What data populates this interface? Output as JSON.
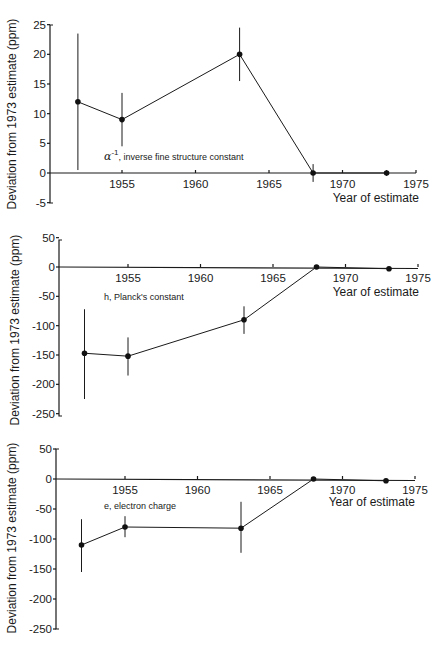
{
  "chart_data": [
    {
      "type": "line",
      "title": "",
      "annotation": "α⁻¹, inverse fine structure constant",
      "annotation_symbol": "α",
      "annotation_sup": "-1",
      "annotation_rest": ", inverse fine structure constant",
      "xlabel": "Year of estimate",
      "ylabel": "Deviation from 1973 estimate (ppm)",
      "xlim": [
        1949.2,
        1975
      ],
      "ylim": [
        -5,
        25
      ],
      "xticks": [
        1955,
        1960,
        1965,
        1970,
        1975
      ],
      "yticks": [
        25,
        20,
        15,
        10,
        5,
        0,
        -5
      ],
      "grid": false,
      "x": [
        1952,
        1955,
        1963,
        1968,
        1973
      ],
      "values": [
        12,
        9,
        20,
        0,
        0
      ],
      "error_low": [
        0.5,
        4.5,
        15.5,
        -1.5,
        -0.5
      ],
      "error_high": [
        23.5,
        13.5,
        24.5,
        1.5,
        0.5
      ]
    },
    {
      "type": "line",
      "title": "",
      "annotation": "h, Planck's constant",
      "xlabel": "Year of estimate",
      "ylabel": "Deviation from 1973 estimate (ppm)",
      "xlim": [
        1949.2,
        1975
      ],
      "ylim": [
        -250,
        50
      ],
      "xticks": [
        1955,
        1960,
        1965,
        1970,
        1975
      ],
      "yticks": [
        50,
        0,
        -50,
        -100,
        -150,
        -200,
        -250
      ],
      "grid": false,
      "x": [
        1952,
        1955,
        1963,
        1968,
        1973
      ],
      "values": [
        -147,
        -152,
        -90,
        0,
        -3
      ],
      "error_low": [
        -225,
        -185,
        -114,
        -3,
        -5
      ],
      "error_high": [
        -72,
        -120,
        -67,
        3,
        -1
      ]
    },
    {
      "type": "line",
      "title": "",
      "annotation": "e, electron charge",
      "xlabel": "Year of estimate",
      "ylabel": "Deviation from 1973 estimate (ppm)",
      "xlim": [
        1949.2,
        1975
      ],
      "ylim": [
        -250,
        50
      ],
      "xticks": [
        1955,
        1960,
        1965,
        1970,
        1975
      ],
      "yticks": [
        50,
        0,
        -50,
        -100,
        -150,
        -200,
        -250
      ],
      "grid": false,
      "x": [
        1952,
        1955,
        1963,
        1968,
        1973
      ],
      "values": [
        -110,
        -80,
        -82,
        0,
        -3
      ],
      "error_low": [
        -155,
        -97,
        -123,
        -2,
        -4
      ],
      "error_high": [
        -67,
        -62,
        -38,
        2,
        -2
      ]
    }
  ],
  "panels": [
    {
      "left": 50,
      "right": 419,
      "top": 25,
      "bottom": 203,
      "zero_y": 173,
      "x1955": 122,
      "px_per_year": 14.7,
      "ylabel_cx": 16,
      "ylabel_cy": 114,
      "annot_x": 104,
      "annot_y": 160,
      "xlabel_x": 419,
      "xlabel_y": 202
    },
    {
      "left": 59,
      "right": 419,
      "top": 240,
      "bottom": 416,
      "zero_y": 267,
      "x1955": 128,
      "px_per_year": 14.5,
      "ylabel_cx": 19,
      "ylabel_cy": 330,
      "annot_x": 104,
      "annot_y": 300,
      "xlabel_x": 419,
      "xlabel_y": 296
    },
    {
      "left": 56,
      "right": 419,
      "top": 449,
      "bottom": 629,
      "zero_y": 479,
      "x1955": 125,
      "px_per_year": 14.5,
      "ylabel_cx": 16,
      "ylabel_cy": 538,
      "annot_x": 104,
      "annot_y": 509,
      "xlabel_x": 415,
      "xlabel_y": 506
    }
  ]
}
